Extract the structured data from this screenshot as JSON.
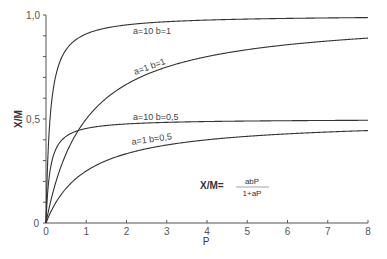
{
  "chart_data": {
    "type": "line",
    "title": "",
    "xlabel": "P",
    "ylabel": "X/M",
    "xlim": [
      0,
      8
    ],
    "ylim": [
      0,
      1.0
    ],
    "grid": false,
    "x_ticks": [
      "0",
      "1",
      "2",
      "3",
      "4",
      "5",
      "6",
      "7",
      "8"
    ],
    "y_ticks": [
      "0",
      "0.5",
      "1.0"
    ],
    "y_tick_labels_display": [
      "0",
      "0,5",
      "1,0"
    ],
    "formula": {
      "lhs": "X/M=",
      "numerator": "abP",
      "denominator": "1+aP"
    },
    "series": [
      {
        "name": "a=10 b=1",
        "a": 10,
        "b": 1,
        "x": [
          0,
          0.1,
          0.2,
          0.5,
          1,
          2,
          4,
          8
        ],
        "values": [
          0,
          0.5,
          0.667,
          0.833,
          0.909,
          0.952,
          0.976,
          0.988
        ]
      },
      {
        "name": "a=1 b=1",
        "a": 1,
        "b": 1,
        "x": [
          0,
          0.5,
          1,
          2,
          4,
          8
        ],
        "values": [
          0,
          0.333,
          0.5,
          0.667,
          0.8,
          0.889
        ]
      },
      {
        "name": "a=10 b=0.5",
        "a": 10,
        "b": 0.5,
        "x": [
          0,
          0.1,
          0.2,
          0.5,
          1,
          2,
          4,
          8
        ],
        "values": [
          0,
          0.25,
          0.333,
          0.417,
          0.455,
          0.476,
          0.488,
          0.494
        ]
      },
      {
        "name": "a=1 b=0.5",
        "a": 1,
        "b": 0.5,
        "x": [
          0,
          0.5,
          1,
          2,
          4,
          8
        ],
        "values": [
          0,
          0.167,
          0.25,
          0.333,
          0.4,
          0.444
        ]
      }
    ],
    "labels": {
      "s1": "a=10 b=1",
      "s2": "a=1 b=1",
      "s3": "a=10 b=0,5",
      "s4": "a=1 b=0,5"
    }
  }
}
